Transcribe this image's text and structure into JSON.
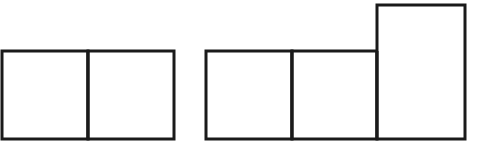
{
  "figure": {
    "type": "geometry-diagram",
    "canvas": {
      "width": 487,
      "height": 163
    },
    "background_color": "#ffffff",
    "stroke_color": "#1a1a1a",
    "stroke_width": 3,
    "fill_color": "#ffffff",
    "groups": [
      {
        "id": "group-left",
        "name": "two-square-domino",
        "cell_count": 2,
        "outline": {
          "x": 2,
          "y": 51,
          "width": 172,
          "height": 88
        },
        "dividers": [
          {
            "orientation": "vertical",
            "x": 88,
            "y1": 51,
            "y2": 139
          }
        ],
        "cells": [
          {
            "id": "left-cell-1",
            "x": 2,
            "y": 51,
            "width": 86,
            "height": 88
          },
          {
            "id": "left-cell-2",
            "x": 88,
            "y": 51,
            "width": 86,
            "height": 88
          }
        ]
      },
      {
        "id": "group-right",
        "name": "l-shaped-tromino",
        "cell_count": 3,
        "outline_path": "M 206 51 L 377 51 L 377 5 L 465 5 L 465 139 L 206 139 Z",
        "dividers": [
          {
            "orientation": "vertical",
            "x": 292,
            "y1": 51,
            "y2": 139
          },
          {
            "orientation": "vertical",
            "x": 377,
            "y1": 51,
            "y2": 139
          }
        ],
        "cells": [
          {
            "id": "right-cell-1",
            "x": 206,
            "y": 51,
            "width": 86,
            "height": 88
          },
          {
            "id": "right-cell-2",
            "x": 292,
            "y": 51,
            "width": 85,
            "height": 88
          },
          {
            "id": "right-cell-3",
            "x": 377,
            "y": 5,
            "width": 88,
            "height": 134
          }
        ]
      }
    ]
  }
}
